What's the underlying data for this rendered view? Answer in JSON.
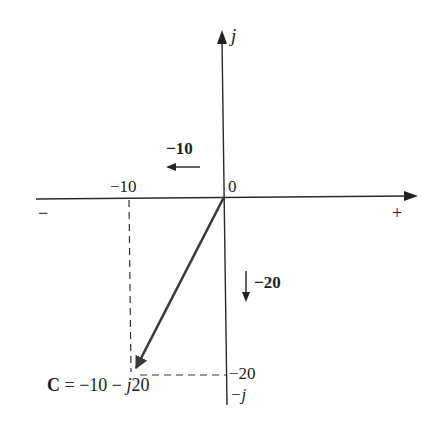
{
  "diagram": {
    "type": "complex-plane",
    "axes": {
      "real_negative_label": "−",
      "real_positive_label": "+",
      "imag_positive_label": "j",
      "imag_negative_label": "−j",
      "origin_label": "0"
    },
    "ticks": {
      "real_tick_label": "−10",
      "imag_tick_label": "−20"
    },
    "components": {
      "real_component_label": "−10",
      "imag_component_label": "−20"
    },
    "phasor": {
      "name": "C",
      "expression_prefix": "C",
      "expression_eq": " = −10 − ",
      "expression_j": "j",
      "expression_suffix": "20",
      "real": -10,
      "imag": -20
    },
    "colors": {
      "axis": "#2a2a2a",
      "vector": "#3a3a3a",
      "dashed": "#333333",
      "background": "#ffffff"
    }
  }
}
